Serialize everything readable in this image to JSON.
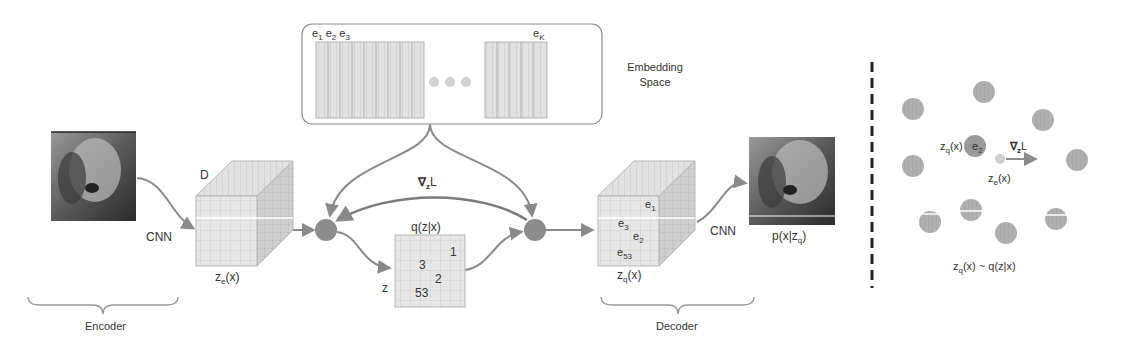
{
  "embedding_space": {
    "title_line1": "Embedding",
    "title_line2": "Space",
    "vector_labels": [
      "e",
      "e",
      "e"
    ],
    "vector_subs": [
      "1",
      "2",
      "3"
    ],
    "last_label": "e",
    "last_sub": "K"
  },
  "encoder": {
    "input_label": "CNN",
    "cube_depth_label": "D",
    "output_label": "z",
    "output_sub": "e",
    "output_suffix": "(x)",
    "brace_label": "Encoder"
  },
  "quantizer": {
    "grad_label": "∇",
    "grad_sub": "z",
    "grad_suffix": "L",
    "grid_title": "q(z|x)",
    "z_label": "z",
    "grid_values": [
      "1",
      "3",
      "2",
      "53"
    ]
  },
  "decoder": {
    "cube_labels": [
      "e",
      "e",
      "e",
      "e"
    ],
    "cube_subs": [
      "1",
      "3",
      "2",
      "53"
    ],
    "output_label": "z",
    "output_sub": "q",
    "output_suffix": "(x)",
    "cnn_label": "CNN",
    "recon_label": "p(x|z",
    "recon_sub": "q",
    "recon_suffix": ")",
    "brace_label": "Decoder"
  },
  "right_panel": {
    "zq_label": "z",
    "zq_sub": "q",
    "zq_suffix": "(x)",
    "e2_label": "e",
    "e2_sub": "2",
    "grad_label": "∇",
    "grad_sub": "z",
    "grad_suffix": "L",
    "ze_label": "z",
    "ze_sub": "e",
    "ze_suffix": "(x)",
    "caption_prefix": "z",
    "caption_sub": "q",
    "caption_suffix": "(x) ~ q(z|x)"
  },
  "colors": {
    "stroke": "#8a8a8a",
    "fill_light": "#dcdcdc",
    "fill_node": "#8c8c8c",
    "text": "#333333"
  }
}
